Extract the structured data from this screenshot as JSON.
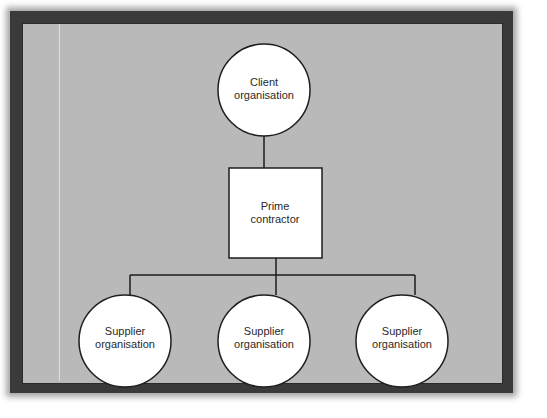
{
  "diagram": {
    "colors": {
      "background": "#ffffff",
      "frame": "#3a3a3a",
      "panel": "#b9b9b9",
      "node_fill": "#ffffff",
      "stroke": "#1e1e1e",
      "text": "#2a2a2a"
    },
    "nodes": {
      "client": {
        "shape": "circle",
        "line1": "Client",
        "line2": "organisation"
      },
      "prime": {
        "shape": "rectangle",
        "line1": "Prime",
        "line2": "contractor"
      },
      "suppliers": [
        {
          "shape": "circle",
          "line1": "Supplier",
          "line2": "organisation"
        },
        {
          "shape": "circle",
          "line1": "Supplier",
          "line2": "organisation"
        },
        {
          "shape": "circle",
          "line1": "Supplier",
          "line2": "organisation"
        }
      ]
    },
    "edges": [
      {
        "from": "client",
        "to": "prime"
      },
      {
        "from": "prime",
        "to": "supplier-1"
      },
      {
        "from": "prime",
        "to": "supplier-2"
      },
      {
        "from": "prime",
        "to": "supplier-3"
      }
    ]
  }
}
